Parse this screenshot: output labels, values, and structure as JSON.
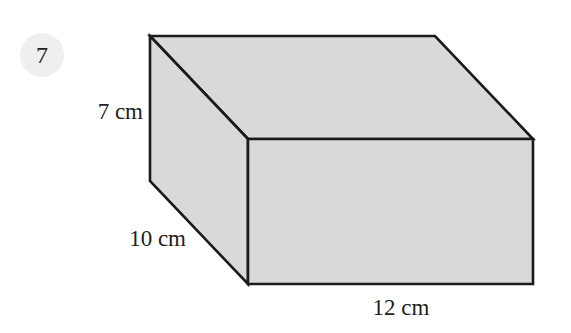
{
  "question": {
    "number": "7",
    "badge_color": "#efefef"
  },
  "figure": {
    "shape": "cuboid",
    "fill_color": "#d9d9d9",
    "edge_color": "#1a1a1a",
    "dimensions": {
      "height": "7 cm",
      "depth": "10 cm",
      "length": "12 cm"
    }
  }
}
